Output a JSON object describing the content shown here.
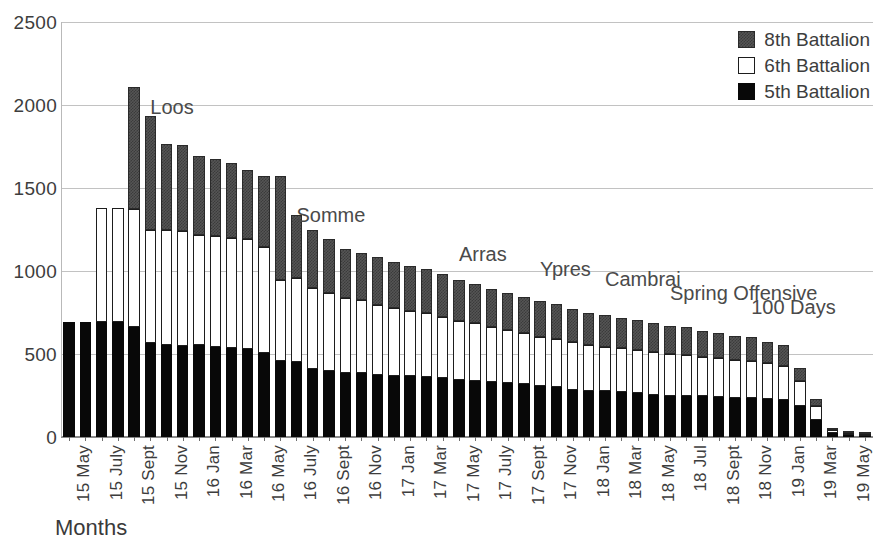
{
  "chart_data": {
    "type": "bar",
    "subtype": "stacked-vertical",
    "title": "",
    "xlabel": "Months",
    "ylabel": "",
    "ylim": [
      0,
      2500
    ],
    "yticks": [
      0,
      500,
      1000,
      1500,
      2000,
      2500
    ],
    "grid": true,
    "legend_position": "top-right",
    "categories": [
      "15 May",
      "15 June",
      "15 July",
      "15 Aug",
      "15 Sept",
      "15 Oct",
      "15 Nov",
      "15 Dec",
      "16 Jan",
      "16 Feb",
      "16 Mar",
      "16 Apr",
      "16 May",
      "16 June",
      "16 July",
      "16 Aug",
      "16 Sept",
      "16 Oct",
      "16 Nov",
      "16 Dec",
      "17 Jan",
      "17 Feb",
      "17 Mar",
      "17 Apr",
      "17 May",
      "17 June",
      "17 July",
      "17 Aug",
      "17 Sept",
      "17 Oct",
      "17 Nov",
      "17 Dec",
      "18 Jan",
      "18 Feb",
      "18 Mar",
      "18 Apr",
      "18 May",
      "18 June",
      "18 Jul",
      "18 Aug",
      "18 Sept",
      "18 Oct",
      "18 Nov",
      "18 Dec",
      "19 Jan",
      "19 Feb",
      "19 Mar",
      "19 Apr",
      "19 May",
      "19 June"
    ],
    "tick_labels": [
      "15 May",
      "",
      "15 July",
      "",
      "15 Sept",
      "",
      "15 Nov",
      "",
      "16 Jan",
      "",
      "16 Mar",
      "",
      "16 May",
      "",
      "16 July",
      "",
      "16 Sept",
      "",
      "16 Nov",
      "",
      "17 Jan",
      "",
      "17 Mar",
      "",
      "17 May",
      "",
      "17 July",
      "",
      "17 Sept",
      "",
      "17 Nov",
      "",
      "18 Jan",
      "",
      "18 Mar",
      "",
      "18 May",
      "",
      "18 Jul",
      "",
      "18 Sept",
      "",
      "18 Nov",
      "",
      "19 Jan",
      "",
      "19 Mar",
      "",
      "19 May",
      ""
    ],
    "series": [
      {
        "name": "5th Battalion",
        "color": "#080808",
        "values": [
          690,
          690,
          690,
          690,
          665,
          565,
          555,
          550,
          555,
          545,
          535,
          530,
          505,
          455,
          450,
          410,
          400,
          385,
          385,
          375,
          370,
          365,
          360,
          355,
          345,
          340,
          330,
          325,
          320,
          305,
          300,
          285,
          280,
          275,
          270,
          265,
          255,
          250,
          250,
          245,
          240,
          235,
          235,
          230,
          225,
          185,
          100,
          25,
          15,
          8
        ]
      },
      {
        "name": "6th Battalion",
        "color": "#ffffff",
        "values": [
          0,
          0,
          690,
          690,
          710,
          680,
          690,
          690,
          665,
          665,
          665,
          660,
          640,
          490,
          510,
          490,
          470,
          450,
          440,
          420,
          405,
          395,
          385,
          370,
          355,
          345,
          330,
          320,
          305,
          300,
          290,
          285,
          275,
          270,
          265,
          260,
          255,
          250,
          245,
          240,
          235,
          230,
          225,
          215,
          205,
          150,
          85,
          18,
          12,
          6
        ]
      },
      {
        "name": "8th Battalion",
        "color": "#555555",
        "values": [
          0,
          0,
          0,
          0,
          735,
          690,
          520,
          520,
          475,
          465,
          450,
          420,
          425,
          630,
          375,
          345,
          320,
          300,
          285,
          290,
          280,
          270,
          265,
          255,
          245,
          235,
          230,
          225,
          220,
          215,
          210,
          200,
          195,
          190,
          185,
          180,
          175,
          170,
          165,
          155,
          150,
          145,
          140,
          130,
          125,
          80,
          45,
          10,
          8,
          5
        ]
      }
    ],
    "annotations": [
      {
        "text": "Loos",
        "x_index": 5,
        "y_value": 2050
      },
      {
        "text": "Somme",
        "x_index": 14,
        "y_value": 1400
      },
      {
        "text": "Arras",
        "x_index": 24,
        "y_value": 1160
      },
      {
        "text": "Ypres",
        "x_index": 29,
        "y_value": 1075
      },
      {
        "text": "Cambrai",
        "x_index": 33,
        "y_value": 1010
      },
      {
        "text": "Spring Offensive",
        "x_index": 37,
        "y_value": 925
      },
      {
        "text": "100 Days",
        "x_index": 42,
        "y_value": 845
      }
    ]
  },
  "legend": {
    "items": [
      {
        "label": "8th Battalion",
        "swatch": "hatched-dark"
      },
      {
        "label": "6th Battalion",
        "swatch": "white-outline"
      },
      {
        "label": "5th Battalion",
        "swatch": "solid-black"
      }
    ]
  }
}
